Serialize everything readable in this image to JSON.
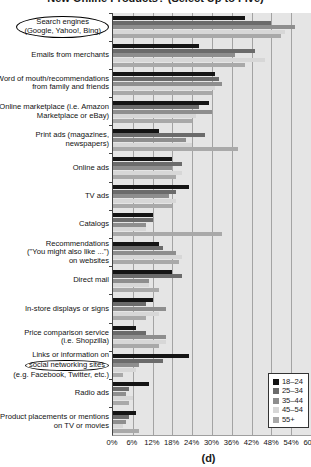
{
  "title_fragment": "New Online Products? (Select Up to Five)",
  "caption": "(d)",
  "colors": {
    "series": [
      "#141414",
      "#6b6b6b",
      "#8e8e8e",
      "#d7d7d7",
      "#a9a9a9"
    ],
    "plot_bg": "#e5e5e5",
    "gridline": "#a3a3a3",
    "axis": "#444444"
  },
  "chart_data": {
    "type": "bar",
    "orientation": "horizontal",
    "xlim": [
      0,
      60
    ],
    "grid": "vertical, every 6%",
    "x_ticks": [
      "0%",
      "6%",
      "12%",
      "18%",
      "24%",
      "30%",
      "36%",
      "42%",
      "48%",
      "54%",
      "60%"
    ],
    "legend_position": "bottom-right",
    "legend": [
      "18–24",
      "25–34",
      "35–44",
      "45–54",
      "55+"
    ],
    "categories": [
      {
        "lines": [
          "Search engines",
          "(Google, Yahoo!, Bing)"
        ],
        "circle": "all"
      },
      {
        "lines": [
          "Emails from merchants"
        ],
        "circle": null
      },
      {
        "lines": [
          "Word of mouth/recommendations",
          "from family and friends"
        ],
        "circle": null
      },
      {
        "lines": [
          "Online marketplace (i.e. Amazon",
          "Marketplace or eBay)"
        ],
        "circle": null
      },
      {
        "lines": [
          "Print ads (magazines,",
          "newspapers)"
        ],
        "circle": null
      },
      {
        "lines": [
          "Online ads"
        ],
        "circle": null
      },
      {
        "lines": [
          "TV ads"
        ],
        "circle": null
      },
      {
        "lines": [
          "Catalogs"
        ],
        "circle": null
      },
      {
        "lines": [
          "Recommendations",
          "(\"You might also like ...\")",
          "on websites"
        ],
        "circle": null
      },
      {
        "lines": [
          "Direct mail"
        ],
        "circle": null
      },
      {
        "lines": [
          "In-store displays or signs"
        ],
        "circle": null
      },
      {
        "lines": [
          "Price comparison service",
          "(i.e. Shopzilla)"
        ],
        "circle": null
      },
      {
        "lines": [
          "Links or information on",
          "social networking sites",
          "(e.g. Facebook, Twitter, etc.)"
        ],
        "circle": "line:1"
      },
      {
        "lines": [
          "Radio ads"
        ],
        "circle": null
      },
      {
        "lines": [
          "Product placements or mentions",
          "on TV or movies"
        ],
        "circle": null
      }
    ],
    "series": [
      {
        "name": "18–24",
        "values": [
          40,
          26,
          31,
          29,
          14,
          18,
          23,
          12,
          14,
          18,
          12,
          7,
          23,
          11,
          7
        ]
      },
      {
        "name": "25–34",
        "values": [
          48,
          43,
          32,
          26,
          28,
          21,
          19,
          12,
          15,
          21,
          10,
          10,
          15,
          5,
          5
        ]
      },
      {
        "name": "35–44",
        "values": [
          55,
          37,
          33,
          30,
          22,
          18,
          17,
          10,
          19,
          11,
          16,
          16,
          8,
          4,
          4
        ]
      },
      {
        "name": "45–54",
        "values": [
          52,
          46,
          31,
          25,
          24,
          21,
          19,
          10,
          21,
          11,
          14,
          16,
          7,
          6,
          3
        ]
      },
      {
        "name": "55+",
        "values": [
          51,
          40,
          30,
          24,
          38,
          19,
          18,
          33,
          20,
          14,
          10,
          14,
          3,
          5,
          8
        ]
      }
    ]
  }
}
